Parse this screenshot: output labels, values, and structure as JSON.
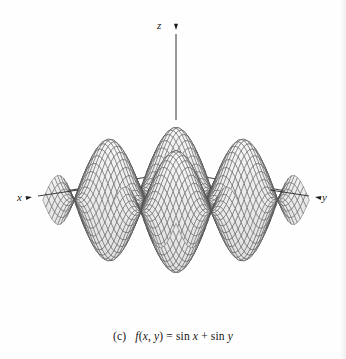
{
  "figure": {
    "caption_index": "(c)",
    "caption_function": "f(x, y) = sin x + sin y",
    "caption_full": "(c)  f(x, y) = sin x + sin y",
    "background_color": "#fefefe",
    "mesh_line_color": "#4a4a4a",
    "mesh_fill_color": "#e8e8e8",
    "axis_color": "#1d1d1d"
  },
  "axes": {
    "z": {
      "label": "z",
      "direction": "up",
      "tip": [
        176,
        30
      ],
      "origin": [
        176,
        200
      ]
    },
    "x": {
      "label": "x",
      "direction": "down-left",
      "tip": [
        32,
        197
      ],
      "origin": [
        176,
        172
      ]
    },
    "y": {
      "label": "y",
      "direction": "down-right",
      "tip": [
        315,
        197
      ],
      "origin": [
        176,
        172
      ]
    }
  },
  "chart_data": {
    "type": "surface",
    "title": "",
    "subtitle": "(c)  f(x, y) = sin x + sin y",
    "function": "sin(x) + sin(y)",
    "xlabel": "x",
    "ylabel": "y",
    "zlabel": "z",
    "xlim": [
      -6.2832,
      6.2832
    ],
    "ylim": [
      -6.2832,
      6.2832
    ],
    "zlim": [
      -2,
      2
    ],
    "samples": 46,
    "grid": false,
    "legend": false,
    "wireframe": true,
    "shaded_fill": true,
    "projection": {
      "type": "axonometric",
      "x_axis_screen_vector": [
        -1,
        0.175
      ],
      "y_axis_screen_vector": [
        1,
        0.175
      ],
      "z_axis_screen_vector": [
        0,
        -1
      ],
      "x_scale": 10.6,
      "y_scale": 10.6,
      "z_scale": 27.5,
      "origin_screen": [
        176,
        200
      ]
    },
    "features": {
      "peak_count": 4,
      "valley_count": 4,
      "max_value": 2,
      "min_value": -2,
      "peaks_screen": [
        {
          "name": "back-center-peak",
          "screen": [
            176,
            91
          ],
          "z": 2
        },
        {
          "name": "left-peak",
          "screen": [
            96,
            126
          ],
          "z": 2
        },
        {
          "name": "right-peak",
          "screen": [
            256,
            126
          ],
          "z": 2
        },
        {
          "name": "front-center-peak",
          "screen": [
            176,
            163
          ],
          "z": 2
        }
      ],
      "valleys_screen": [
        {
          "name": "front-center-valley",
          "screen": [
            176,
            308
          ],
          "z": -2
        },
        {
          "name": "left-front-valley",
          "screen": [
            96,
            265
          ],
          "z": -2
        },
        {
          "name": "right-front-valley",
          "screen": [
            256,
            265
          ],
          "z": -2
        }
      ]
    }
  }
}
